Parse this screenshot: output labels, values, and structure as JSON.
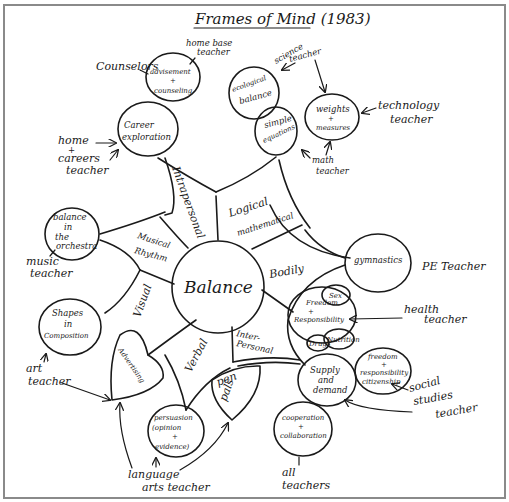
{
  "title": "Frames of Mind (1983)",
  "center": "Balance",
  "intelligences": {
    "intrapersonal": "Intrapersonal",
    "logical": "Logical mathematical",
    "logical_l1": "Logical",
    "logical_l2": "mathematical",
    "bodily": "Bodily",
    "interpersonal_l1": "Inter-",
    "interpersonal_l2": "Personal",
    "verbal": "Verbal",
    "visual": "Visual",
    "musical_l1": "Musical",
    "musical_l2": "Rhythm"
  },
  "nodes": {
    "advisement": {
      "l1": "advisement",
      "l2": "+",
      "l3": "counseling"
    },
    "career": {
      "l1": "Career",
      "l2": "exploration"
    },
    "ecological": {
      "l1": "ecological",
      "l2": "balance"
    },
    "simple_eq": {
      "l1": "simple",
      "l2": "equations"
    },
    "weights": {
      "l1": "weights",
      "l2": "+",
      "l3": "measures"
    },
    "orchestra": {
      "l1": "balance",
      "l2": "in",
      "l3": "the",
      "l4": "orchestra"
    },
    "gymnastics": {
      "l1": "gymnastics"
    },
    "freedom_resp": {
      "l1": "Freedom",
      "l2": "+",
      "l3": "Responsibility"
    },
    "sex": {
      "l1": "Sex"
    },
    "drugs": {
      "l1": "Drugs"
    },
    "nutrition": {
      "l1": "Nutrition"
    },
    "shapes": {
      "l1": "Shapes",
      "l2": "in",
      "l3": "Composition"
    },
    "advertising": {
      "l1": "Advertising"
    },
    "pen_pals": {
      "l1": "pen",
      "l2": "pals"
    },
    "persuasion": {
      "l1": "persuasion",
      "l2": "(opinion",
      "l3": "+",
      "l4": "evidence)"
    },
    "supply": {
      "l1": "Supply",
      "l2": "and",
      "l3": "demand"
    },
    "citizenship": {
      "l1": "freedom",
      "l2": "+",
      "l3": "responsibility",
      "l4": "citizenship"
    },
    "cooperation": {
      "l1": "cooperation",
      "l2": "+",
      "l3": "collaboration"
    }
  },
  "teachers": {
    "counselors": "Counselors",
    "home_base": {
      "l1": "home base",
      "l2": "teacher"
    },
    "science": {
      "l1": "science",
      "l2": "teacher"
    },
    "technology": {
      "l1": "technology",
      "l2": "teacher"
    },
    "math": {
      "l1": "math",
      "l2": "teacher"
    },
    "home_careers": {
      "l1": "home",
      "l2": "+",
      "l3": "careers",
      "l4": "teacher"
    },
    "music": {
      "l1": "music",
      "l2": "teacher"
    },
    "pe": "PE Teacher",
    "health": {
      "l1": "health",
      "l2": "teacher"
    },
    "art": {
      "l1": "art",
      "l2": "teacher"
    },
    "social_studies": {
      "l1": "social",
      "l2": "studies",
      "l3": "teacher"
    },
    "language_arts": {
      "l1": "language",
      "l2": "arts teacher"
    },
    "all": {
      "l1": "all",
      "l2": "teachers"
    }
  },
  "colors": {
    "ink": "#1a1a1a",
    "frame": "#8a8a8a",
    "paper": "#ffffff"
  }
}
